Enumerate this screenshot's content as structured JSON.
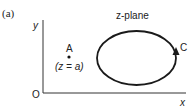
{
  "figure": {
    "panel_label": "(a)",
    "plane_title": "z-plane",
    "axes": {
      "x_label": "x",
      "y_label": "y",
      "origin_label": "O"
    },
    "point": {
      "label": "A",
      "annotation": "(z = a)"
    },
    "contour": {
      "label": "C",
      "direction": "counterclockwise"
    },
    "colors": {
      "stroke": "#1a1a1a",
      "axis": "#333333"
    }
  }
}
